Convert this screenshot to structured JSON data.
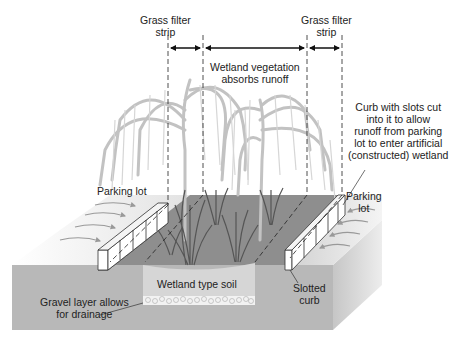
{
  "diagram": {
    "type": "constructed-wetland-cross-section",
    "labels": {
      "grass_filter_left": [
        "Grass filter",
        "strip"
      ],
      "grass_filter_right": [
        "Grass filter",
        "strip"
      ],
      "wetland_vegetation": [
        "Wetland vegetation",
        "absorbs runoff"
      ],
      "curb_description": [
        "Curb with slots cut",
        "into it to allow",
        "runoff from parking",
        "lot to enter artificial",
        "(constructed) wetland"
      ],
      "parking_lot_left": "Parking lot",
      "parking_lot_right": [
        "Parking",
        "lot"
      ],
      "wetland_soil": "Wetland type soil",
      "gravel_layer": [
        "Gravel layer allows",
        "for drainage"
      ],
      "slotted_curb": [
        "Slotted",
        "curb"
      ]
    },
    "colors": {
      "ground_top": "#c8c8c8",
      "ground_front": "#b4b4b4",
      "ground_side": "#d2d2d2",
      "wetland_surface": "#8c8c8c",
      "soil_zone": "#d6d6d6",
      "gravel": "#f0f0f0",
      "trees": "#c4c4c4",
      "reeds": "#5a5a5a",
      "curb": "#ffffff",
      "text": "#222222"
    }
  }
}
